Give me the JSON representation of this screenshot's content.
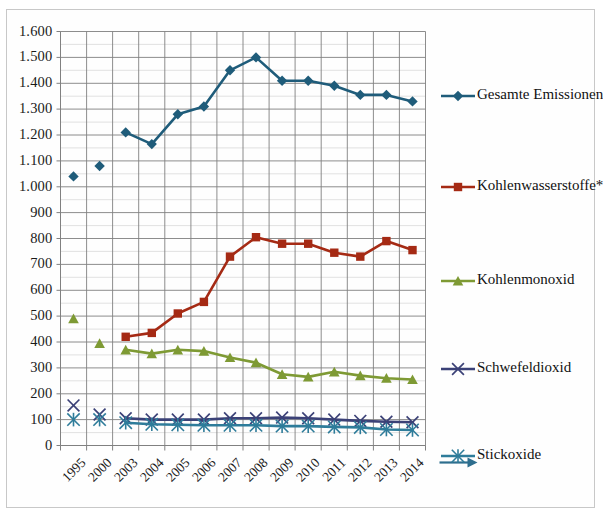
{
  "figure": {
    "background_color": "#fefefe",
    "frame_color": "#c8c8c8",
    "grid_major_color": "#808080",
    "grid_minor_color": "#d9d9d9",
    "axis_color": "#808080"
  },
  "chart_data": {
    "type": "line",
    "title": "",
    "subtitle": "",
    "xlabel": "",
    "ylabel": "",
    "grid": true,
    "legend_position": "right",
    "ylim": [
      0,
      1600
    ],
    "ytick_step": 100,
    "yminor_step": 50,
    "categories": [
      "1995",
      "2000",
      "2003",
      "2004",
      "2005",
      "2006",
      "2007",
      "2008",
      "2009",
      "2010",
      "2011",
      "2012",
      "2013",
      "2014"
    ],
    "ytick_labels": [
      "1.600",
      "1.500",
      "1.400",
      "1.300",
      "1.200",
      "1.100",
      "1.000",
      "900",
      "800",
      "700",
      "600",
      "500",
      "400",
      "300",
      "200",
      "100",
      "0"
    ],
    "series": [
      {
        "name": "Gesamte Emissionen",
        "color": "#1F5C7A",
        "marker": "diamond",
        "connect_gaps": false,
        "values": [
          1040,
          1080,
          1210,
          1165,
          1280,
          1310,
          1450,
          1500,
          1410,
          1410,
          1390,
          1355,
          1355,
          1330
        ]
      },
      {
        "name": "Kohlenwasserstoffe*",
        "color": "#A52A14",
        "marker": "square",
        "connect_gaps": false,
        "values": [
          null,
          null,
          420,
          435,
          510,
          555,
          730,
          805,
          780,
          780,
          745,
          730,
          790,
          755
        ]
      },
      {
        "name": "Kohlenmonoxid",
        "color": "#7E9A34",
        "marker": "triangle",
        "connect_gaps": false,
        "values": [
          490,
          395,
          370,
          355,
          370,
          365,
          340,
          320,
          275,
          265,
          285,
          270,
          260,
          255
        ]
      },
      {
        "name": "Schwefeldioxid",
        "color": "#3B4177",
        "marker": "x",
        "connect_gaps": false,
        "values": [
          155,
          120,
          105,
          100,
          100,
          100,
          105,
          105,
          108,
          105,
          100,
          95,
          92,
          90
        ]
      },
      {
        "name": "Stickoxide",
        "color": "#2E7C9A",
        "marker": "star",
        "connect_gaps": false,
        "values": [
          100,
          100,
          88,
          82,
          80,
          78,
          78,
          78,
          75,
          75,
          72,
          70,
          62,
          60
        ]
      }
    ],
    "legend": [
      {
        "label": "Gesamte Emissionen",
        "color": "#1F5C7A",
        "marker": "diamond"
      },
      {
        "label": "Kohlenwasserstoffe*",
        "color": "#A52A14",
        "marker": "square"
      },
      {
        "label": "Kohlenmonoxid",
        "color": "#7E9A34",
        "marker": "triangle"
      },
      {
        "label": "Schwefeldioxid",
        "color": "#3B4177",
        "marker": "x"
      },
      {
        "label": "Stickoxide",
        "color": "#2E7C9A",
        "marker": "star"
      }
    ]
  }
}
